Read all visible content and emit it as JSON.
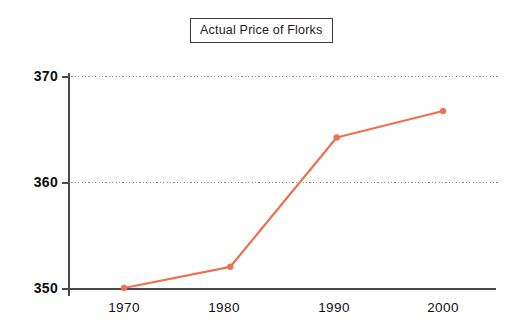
{
  "chart_data": {
    "type": "line",
    "title": "Actual Price of Florks",
    "xlabel": "",
    "ylabel": "",
    "categories": [
      "1970",
      "1980",
      "1990",
      "2000"
    ],
    "x": [
      1970,
      1980,
      1990,
      2000
    ],
    "values": [
      350,
      352,
      364.2,
      366.7
    ],
    "series": [
      {
        "name": "Actual Price of Florks",
        "values": [
          350,
          352,
          364.2,
          366.7
        ],
        "color": "#ed7150",
        "marker": "circle",
        "line_width": 2
      }
    ],
    "ylim": [
      350,
      370
    ],
    "yticks": [
      350,
      360,
      370
    ],
    "ytick_labels": [
      "350",
      "360",
      "370"
    ],
    "xticks": [
      1970,
      1980,
      1990,
      2000
    ],
    "xtick_labels": [
      "1970",
      "1980",
      "1990",
      "2000"
    ],
    "xlim": [
      1964,
      2007
    ],
    "grid": "horizontal-dotted",
    "legend": "none",
    "background": "#ffffff",
    "axis_color": "#4a4a4a",
    "grid_color": "#8a8a8a"
  },
  "axes": {
    "y_ticks": [
      {
        "label": "370",
        "value": 370
      },
      {
        "label": "360",
        "value": 360
      },
      {
        "label": "350",
        "value": 350
      }
    ],
    "x_ticks": [
      {
        "label": "1970",
        "value": 1970
      },
      {
        "label": "1980",
        "value": 1980
      },
      {
        "label": "1990",
        "value": 1990
      },
      {
        "label": "2000",
        "value": 2000
      }
    ]
  },
  "title": {
    "text": "Actual Price of Florks"
  },
  "colors": {
    "series": "#ed7150",
    "axis": "#4a4a4a",
    "grid": "#8a8a8a",
    "text": "#111111",
    "background": "#ffffff"
  }
}
